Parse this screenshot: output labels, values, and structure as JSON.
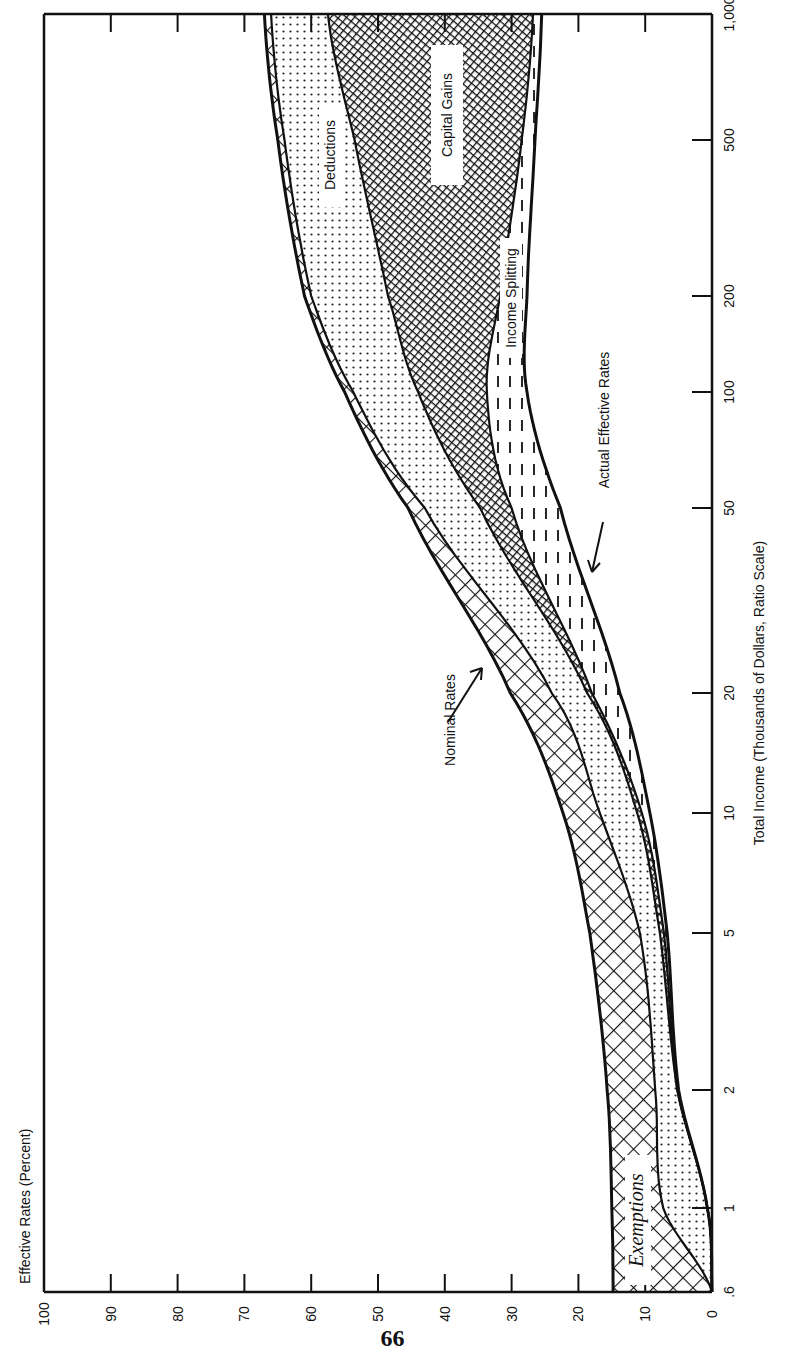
{
  "page": {
    "page_number": "66"
  },
  "chart_data": {
    "type": "area",
    "orientation": "rotated-90-ccw",
    "title": "",
    "xlabel": "Total Income (Thousands of Dollars, Ratio Scale)",
    "ylabel": "Effective Rates (Percent)",
    "x_scale": "log",
    "x_ticks": [
      0.6,
      1,
      2,
      5,
      10,
      20,
      50,
      100,
      200,
      500,
      1000
    ],
    "x_tick_labels": [
      ".6",
      "1",
      "2",
      "5",
      "10",
      "20",
      "50",
      "100",
      "200",
      "500",
      "1,000"
    ],
    "y_ticks": [
      0,
      10,
      20,
      30,
      40,
      50,
      60,
      70,
      80,
      90,
      100
    ],
    "y_tick_labels": [
      "0",
      "10",
      "20",
      "30",
      "40",
      "50",
      "60",
      "70",
      "80",
      "90",
      "100"
    ],
    "ylim": [
      0,
      100
    ],
    "xlim": [
      0.6,
      1000
    ],
    "grid": false,
    "x": [
      0.6,
      1,
      2,
      5,
      10,
      20,
      50,
      100,
      200,
      500,
      1000
    ],
    "series": [
      {
        "name": "Nominal Rates",
        "values": [
          14.8,
          15.0,
          15.7,
          18.3,
          22.3,
          30.2,
          45.5,
          55.0,
          61.0,
          65.0,
          67.0
        ]
      },
      {
        "name": "After Exemptions",
        "values": [
          0.0,
          7.3,
          8.5,
          10.8,
          16.8,
          24.0,
          43.0,
          53.7,
          60.0,
          64.0,
          66.0
        ]
      },
      {
        "name": "After Deductions",
        "values": [
          0.0,
          0.7,
          5.2,
          7.8,
          11.2,
          18.7,
          34.7,
          44.0,
          48.5,
          53.5,
          57.5
        ]
      },
      {
        "name": "After Capital Gains",
        "values": [
          0.0,
          0.7,
          5.2,
          7.2,
          10.5,
          18.0,
          30.0,
          33.7,
          31.7,
          28.5,
          26.8
        ]
      },
      {
        "name": "Actual Effective Rates",
        "values": [
          0.0,
          0.7,
          5.0,
          6.7,
          9.3,
          13.8,
          22.7,
          27.7,
          27.7,
          26.5,
          25.5
        ]
      }
    ],
    "bands": [
      {
        "name": "Exemptions",
        "between": [
          "Nominal Rates",
          "After Exemptions"
        ],
        "pattern": "crosshatch"
      },
      {
        "name": "Deductions",
        "between": [
          "After Exemptions",
          "After Deductions"
        ],
        "pattern": "dots"
      },
      {
        "name": "Capital Gains",
        "between": [
          "After Deductions",
          "After Capital Gains"
        ],
        "pattern": "dense-crosshatch"
      },
      {
        "name": "Income Splitting",
        "between": [
          "After Capital Gains",
          "Actual Effective Rates"
        ],
        "pattern": "dashes"
      }
    ],
    "annotations": [
      {
        "text": "Nominal Rates",
        "points_to": "Nominal Rates",
        "at_x": 25
      },
      {
        "text": "Actual Effective Rates",
        "points_to": "Actual Effective Rates",
        "at_x": 40
      },
      {
        "text": "Exemptions",
        "style": "italic-serif"
      },
      {
        "text": "Deductions"
      },
      {
        "text": "Capital Gains"
      },
      {
        "text": "Income Splitting"
      }
    ]
  }
}
